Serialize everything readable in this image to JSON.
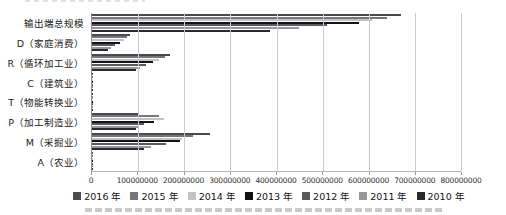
{
  "chart_data": {
    "type": "bar",
    "orientation": "horizontal",
    "title": "",
    "xlabel": "",
    "ylabel": "",
    "xlim": [
      0,
      800000000
    ],
    "grid": "vertical",
    "legend_position": "bottom",
    "categories": [
      "输出端总规模",
      "D（家庭消费）",
      "R（循环加工业）",
      "C（建筑业）",
      "T（物能转换业）",
      "P（加工制造业）",
      "M（采掘业）",
      "A（农业）"
    ],
    "x_ticks": [
      "0",
      "100000000",
      "200000000",
      "300000000",
      "400000000",
      "500000000",
      "600000000",
      "700000000",
      "800000000"
    ],
    "series": [
      {
        "name": "2016 年",
        "color": "#4a4a4e",
        "values": [
          670000000,
          82000000,
          170000000,
          2000000,
          2600000,
          102000000,
          255000000,
          2000000
        ]
      },
      {
        "name": "2015 年",
        "color": "#77777b",
        "values": [
          640000000,
          76000000,
          158000000,
          1800000,
          2400000,
          145000000,
          218000000,
          1800000
        ]
      },
      {
        "name": "2014 年",
        "color": "#c3c3c5",
        "values": [
          606000000,
          69000000,
          146000000,
          1700000,
          2200000,
          156000000,
          196000000,
          1600000
        ]
      },
      {
        "name": "2013 年",
        "color": "#131315",
        "values": [
          578000000,
          60000000,
          133000000,
          1600000,
          2000000,
          134000000,
          190000000,
          1500000
        ]
      },
      {
        "name": "2012 年",
        "color": "#5a5a5e",
        "values": [
          510000000,
          50000000,
          116000000,
          1400000,
          1800000,
          113000000,
          160000000,
          1300000
        ]
      },
      {
        "name": "2011 年",
        "color": "#97979b",
        "values": [
          448000000,
          41000000,
          104000000,
          1200000,
          1500000,
          102000000,
          128000000,
          1200000
        ]
      },
      {
        "name": "2010 年",
        "color": "#2a2a2c",
        "values": [
          386000000,
          34000000,
          95000000,
          1000000,
          1300000,
          95000000,
          113000000,
          1000000
        ]
      }
    ],
    "colors": {
      "gridline": "#cccccc",
      "axis_line": "#8f8f8f",
      "text": "#1b1b1b"
    }
  }
}
